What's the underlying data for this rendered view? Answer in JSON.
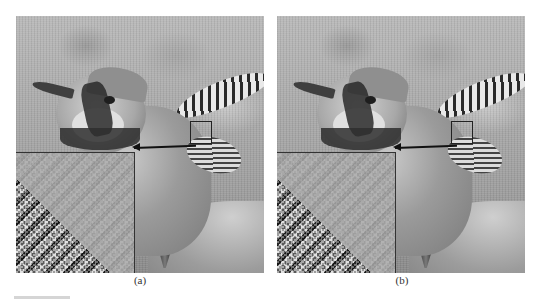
{
  "figure": {
    "panels": [
      {
        "id": "a",
        "caption": "(a)",
        "description": "Blue jay photograph, processed result (a) with magnified inset of highlighted region"
      },
      {
        "id": "b",
        "caption": "(b)",
        "description": "Blue jay photograph, processed result (b) with magnified inset of highlighted region"
      }
    ],
    "colors": {
      "background": "#ffffff",
      "annotation": "#111111",
      "caption": "#333333"
    }
  }
}
